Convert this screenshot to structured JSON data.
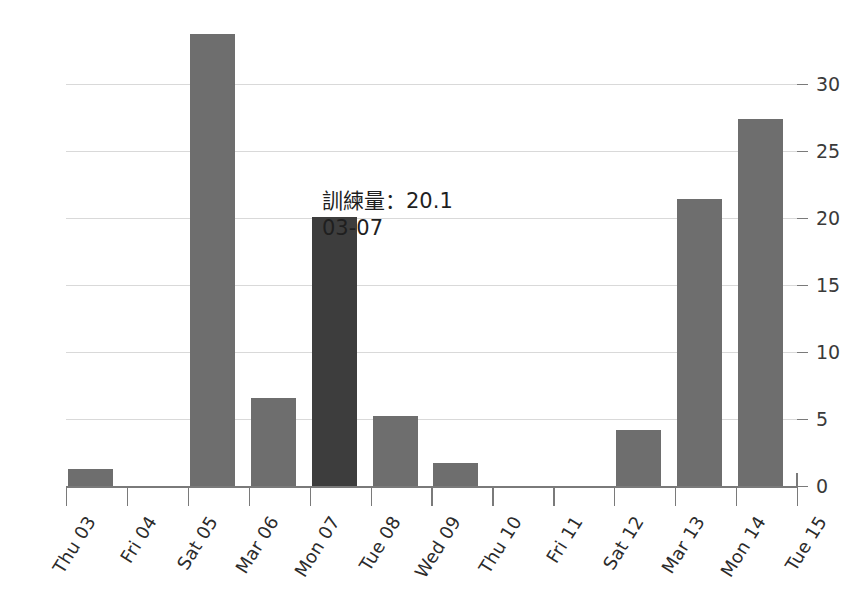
{
  "chart_data": {
    "type": "bar",
    "title": "",
    "xlabel": "",
    "ylabel": "",
    "categories": [
      "Thu 03",
      "Fri 04",
      "Sat 05",
      "Mar 06",
      "Mon 07",
      "Tue 08",
      "Wed 09",
      "Thu 10",
      "Fri 11",
      "Sat 12",
      "Mar 13",
      "Mon 14",
      "Tue 15"
    ],
    "values": [
      1.3,
      0,
      33.7,
      6.6,
      20.1,
      5.2,
      1.7,
      0,
      0,
      4.2,
      21.4,
      27.4,
      0
    ],
    "highlighted_index": 4,
    "ylim": [
      0,
      33.7
    ],
    "yticks": [
      0,
      5,
      10,
      15,
      20,
      25,
      30
    ],
    "ytick_labels": [
      "0",
      "5",
      "10",
      "15",
      "20",
      "25",
      "30"
    ],
    "grid": true,
    "y_axis_position": "right",
    "legend": null,
    "series": [
      {
        "name": "訓練量",
        "values": [
          1.3,
          0,
          33.7,
          6.6,
          20.1,
          5.2,
          1.7,
          0,
          0,
          4.2,
          21.4,
          27.4,
          0
        ]
      }
    ]
  },
  "tooltip": {
    "value_line": "訓練量：20.1",
    "date_line": "03-07",
    "metric_name": "訓練量",
    "metric_value": "20.1"
  },
  "colors": {
    "bar": "#6e6e6e",
    "bar_highlight": "#3d3d3d",
    "gridline": "#d9d9d9",
    "axis": "#7a7a7a",
    "text": "#2b2b2b",
    "background": "#ffffff"
  }
}
